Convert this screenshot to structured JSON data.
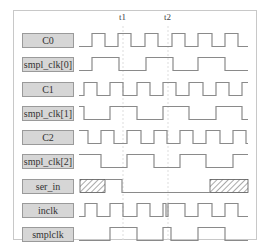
{
  "colors": {
    "wave": "#8a8a8a",
    "label_bg": "#d6d6d6",
    "label_border": "#9a9a9a",
    "frame": "#c8c8c8",
    "marker_line": "#dddddd",
    "hatch": "#555555"
  },
  "markers": [
    {
      "label": "t1",
      "x": 123
    },
    {
      "label": "t2",
      "x": 168
    }
  ],
  "layout": {
    "x_start": 79,
    "x_end": 248,
    "row_amp": 13
  },
  "signals": [
    {
      "name": "C0",
      "y": 40,
      "edges": [
        [
          79,
          0
        ],
        [
          92,
          1
        ],
        [
          105,
          0
        ],
        [
          118,
          1
        ],
        [
          131,
          0
        ],
        [
          145,
          1
        ],
        [
          158,
          0
        ],
        [
          172,
          1
        ],
        [
          185,
          0
        ],
        [
          198,
          1
        ],
        [
          212,
          0
        ],
        [
          225,
          1
        ],
        [
          238,
          0
        ]
      ]
    },
    {
      "name": "smpl_clk[0]",
      "y": 64,
      "edges": [
        [
          79,
          0
        ],
        [
          92,
          1
        ],
        [
          119,
          0
        ],
        [
          146,
          1
        ],
        [
          173,
          0
        ],
        [
          198,
          1
        ],
        [
          225,
          0
        ]
      ]
    },
    {
      "name": "C1",
      "y": 89,
      "edges": [
        [
          79,
          0
        ],
        [
          84,
          1
        ],
        [
          97,
          0
        ],
        [
          110,
          1
        ],
        [
          123,
          0
        ],
        [
          137,
          1
        ],
        [
          150,
          0
        ],
        [
          163,
          1
        ],
        [
          176,
          0
        ],
        [
          189,
          1
        ],
        [
          203,
          0
        ],
        [
          216,
          1
        ],
        [
          229,
          0
        ],
        [
          242,
          1
        ]
      ]
    },
    {
      "name": "smpl_clk[1]",
      "y": 113,
      "edges": [
        [
          79,
          1
        ],
        [
          84,
          0
        ],
        [
          110,
          1
        ],
        [
          137,
          0
        ],
        [
          163,
          1
        ],
        [
          189,
          0
        ],
        [
          216,
          1
        ],
        [
          242,
          0
        ]
      ]
    },
    {
      "name": "C2",
      "y": 137,
      "edges": [
        [
          79,
          1
        ],
        [
          88,
          0
        ],
        [
          101,
          1
        ],
        [
          114,
          0
        ],
        [
          127,
          1
        ],
        [
          141,
          0
        ],
        [
          154,
          1
        ],
        [
          167,
          0
        ],
        [
          180,
          1
        ],
        [
          193,
          0
        ],
        [
          206,
          1
        ],
        [
          220,
          0
        ],
        [
          233,
          1
        ],
        [
          246,
          0
        ]
      ]
    },
    {
      "name": "smpl_clk[2]",
      "y": 161,
      "edges": [
        [
          79,
          1
        ],
        [
          101,
          0
        ],
        [
          127,
          1
        ],
        [
          154,
          0
        ],
        [
          180,
          1
        ],
        [
          206,
          0
        ],
        [
          233,
          1
        ]
      ]
    },
    {
      "name": "ser_in",
      "y": 186,
      "edges": [
        [
          105,
          1
        ],
        [
          122,
          0
        ]
      ],
      "hatched": [
        [
          80,
          105
        ],
        [
          210,
          248
        ]
      ]
    },
    {
      "name": "inclk",
      "y": 210,
      "edges": [
        [
          79,
          0
        ],
        [
          85,
          1
        ],
        [
          97,
          0
        ],
        [
          110,
          1
        ],
        [
          123,
          0
        ],
        [
          137,
          1
        ],
        [
          150,
          0
        ],
        [
          163,
          1
        ],
        [
          166,
          0
        ],
        [
          168,
          1
        ],
        [
          185,
          0
        ],
        [
          198,
          1
        ],
        [
          212,
          0
        ],
        [
          225,
          1
        ],
        [
          238,
          0
        ]
      ]
    },
    {
      "name": "smplclk",
      "y": 234,
      "edges": [
        [
          79,
          0
        ],
        [
          110,
          1
        ],
        [
          137,
          0
        ],
        [
          163,
          1
        ],
        [
          171,
          0
        ],
        [
          198,
          1
        ],
        [
          225,
          0
        ]
      ]
    }
  ]
}
